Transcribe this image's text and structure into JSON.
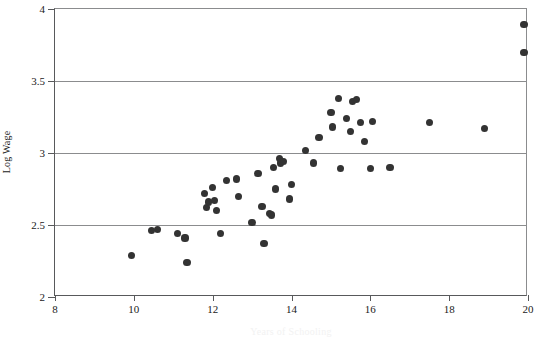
{
  "figure": {
    "background_color": "#ffffff",
    "frame_color": "#58595b",
    "grid_color": "#8b8c8e",
    "marker_color": "#333333"
  },
  "chart_data": {
    "type": "scatter",
    "title": "",
    "xlabel": "Years of Schooling",
    "ylabel": "Log Wage",
    "xlim": [
      8,
      20
    ],
    "ylim": [
      2,
      4
    ],
    "xticks": [
      8,
      10,
      12,
      14,
      16,
      18,
      20
    ],
    "xtick_labels": [
      "8",
      "10",
      "12",
      "14",
      "16",
      "18",
      "20"
    ],
    "yticks": [
      2,
      2.5,
      3,
      3.5,
      4
    ],
    "ytick_labels": [
      "2",
      "2.5",
      "3",
      "3.5",
      "4"
    ],
    "grid": "horizontal",
    "gridlines_y": [
      2.5,
      3,
      3.5
    ],
    "legend": "none",
    "marker": "filled-circle",
    "marker_size": 7,
    "n_points": 53,
    "points": [
      {
        "x": 9.95,
        "y": 2.29
      },
      {
        "x": 10.45,
        "y": 2.46
      },
      {
        "x": 10.6,
        "y": 2.47
      },
      {
        "x": 11.1,
        "y": 2.44
      },
      {
        "x": 11.3,
        "y": 2.41
      },
      {
        "x": 11.35,
        "y": 2.24
      },
      {
        "x": 11.8,
        "y": 2.72
      },
      {
        "x": 11.85,
        "y": 2.62
      },
      {
        "x": 11.9,
        "y": 2.66
      },
      {
        "x": 12.0,
        "y": 2.76
      },
      {
        "x": 12.05,
        "y": 2.67
      },
      {
        "x": 12.1,
        "y": 2.6
      },
      {
        "x": 12.2,
        "y": 2.44
      },
      {
        "x": 12.35,
        "y": 2.81
      },
      {
        "x": 12.6,
        "y": 2.82
      },
      {
        "x": 12.65,
        "y": 2.7
      },
      {
        "x": 13.0,
        "y": 2.52
      },
      {
        "x": 13.15,
        "y": 2.86
      },
      {
        "x": 13.25,
        "y": 2.63
      },
      {
        "x": 13.3,
        "y": 2.37
      },
      {
        "x": 13.45,
        "y": 2.58
      },
      {
        "x": 13.5,
        "y": 2.57
      },
      {
        "x": 13.55,
        "y": 2.9
      },
      {
        "x": 13.6,
        "y": 2.75
      },
      {
        "x": 13.7,
        "y": 2.96
      },
      {
        "x": 13.72,
        "y": 2.93
      },
      {
        "x": 13.8,
        "y": 2.94
      },
      {
        "x": 13.95,
        "y": 2.68
      },
      {
        "x": 14.0,
        "y": 2.78
      },
      {
        "x": 14.35,
        "y": 3.02
      },
      {
        "x": 14.55,
        "y": 2.93
      },
      {
        "x": 14.7,
        "y": 3.11
      },
      {
        "x": 15.0,
        "y": 3.28
      },
      {
        "x": 15.05,
        "y": 3.18
      },
      {
        "x": 15.2,
        "y": 3.38
      },
      {
        "x": 15.25,
        "y": 2.89
      },
      {
        "x": 15.4,
        "y": 3.24
      },
      {
        "x": 15.5,
        "y": 3.15
      },
      {
        "x": 15.55,
        "y": 3.36
      },
      {
        "x": 15.65,
        "y": 3.37
      },
      {
        "x": 15.75,
        "y": 3.21
      },
      {
        "x": 15.85,
        "y": 3.08
      },
      {
        "x": 16.0,
        "y": 2.89
      },
      {
        "x": 16.05,
        "y": 3.22
      },
      {
        "x": 16.5,
        "y": 2.9
      },
      {
        "x": 17.5,
        "y": 3.21
      },
      {
        "x": 18.9,
        "y": 3.17
      },
      {
        "x": 19.9,
        "y": 3.89
      },
      {
        "x": 19.9,
        "y": 3.7
      }
    ]
  }
}
